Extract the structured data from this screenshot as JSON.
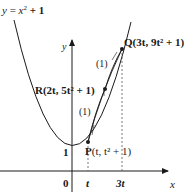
{
  "diagram": {
    "curve_label": "y = x² + 1",
    "curve_label_parts": {
      "y": "y",
      "eq": " = ",
      "x": "x",
      "sup": "2",
      "plus": " + 1"
    },
    "axes": {
      "x_label": "x",
      "y_label": "y",
      "origin": "0"
    },
    "y_tick": "1",
    "x_ticks": [
      "t",
      "3t"
    ],
    "points": {
      "P": {
        "name": "P",
        "coords": "(t, t² + 1)"
      },
      "R": {
        "name": "R",
        "coords": "(2t, 5t² + 1)"
      },
      "Q": {
        "name": "Q",
        "coords": "(3t, 9t² + 1)"
      }
    },
    "line_labels": [
      "(1)",
      "(1)",
      "(1)"
    ],
    "colors": {
      "ink": "#1a1a1a",
      "background": "#ffffff"
    }
  }
}
